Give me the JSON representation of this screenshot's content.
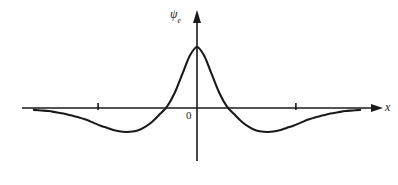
{
  "figure": {
    "background_color": "#ffffff",
    "stroke_color": "#1a1a1a",
    "width": 398,
    "height": 185
  },
  "labels": {
    "y_axis_symbol": "ψ",
    "y_axis_subscript": "e",
    "x_axis": "x",
    "origin": "0"
  },
  "chart_data": {
    "type": "line",
    "title": "",
    "xlabel": "x",
    "ylabel": "ψe",
    "subtitle": "",
    "grid": false,
    "legend": null,
    "axis_style": "arrowed-cartesian",
    "xlim": [
      -3.6,
      3.6
    ],
    "ylim": [
      -0.45,
      1.05
    ],
    "x_tick_values": [
      -2,
      2
    ],
    "x_tick_labels": [
      "",
      ""
    ],
    "y_tick_values": [],
    "y_tick_labels": [],
    "annotations": [
      {
        "text": "0",
        "x": -0.15,
        "y": -0.12,
        "role": "origin-marker"
      },
      {
        "text": "ψe",
        "x": -0.35,
        "y": 1.0,
        "role": "y-axis-name"
      },
      {
        "text": "x",
        "x": 3.55,
        "y": -0.05,
        "role": "x-axis-name"
      }
    ],
    "features": {
      "peak": {
        "x": 0.0,
        "y": 1.0
      },
      "zero_crossings": [
        -0.62,
        0.62
      ],
      "minima": [
        {
          "x": -1.28,
          "y": -0.39
        },
        {
          "x": 1.28,
          "y": -0.39
        }
      ],
      "tails_approach": 0.0,
      "symmetry": "even"
    },
    "series": [
      {
        "name": "psi_e",
        "description": "Symmetric sinc-like wavefunction with central maximum, two side minima and decaying tails",
        "x": [
          -3.3,
          -3.15,
          -3.0,
          -2.85,
          -2.7,
          -2.55,
          -2.4,
          -2.25,
          -2.1,
          -1.95,
          -1.8,
          -1.65,
          -1.5,
          -1.35,
          -1.2,
          -1.05,
          -0.9,
          -0.75,
          -0.6,
          -0.45,
          -0.3,
          -0.15,
          0.0,
          0.15,
          0.3,
          0.45,
          0.6,
          0.75,
          0.9,
          1.05,
          1.2,
          1.35,
          1.5,
          1.65,
          1.8,
          1.95,
          2.1,
          2.25,
          2.4,
          2.55,
          2.7,
          2.85,
          3.0,
          3.15,
          3.3
        ],
        "y": [
          -0.03,
          -0.04,
          -0.05,
          -0.07,
          -0.09,
          -0.12,
          -0.15,
          -0.19,
          -0.24,
          -0.29,
          -0.33,
          -0.37,
          -0.39,
          -0.39,
          -0.37,
          -0.31,
          -0.22,
          -0.1,
          0.03,
          0.25,
          0.55,
          0.85,
          1.0,
          0.85,
          0.55,
          0.25,
          0.03,
          -0.1,
          -0.22,
          -0.31,
          -0.37,
          -0.39,
          -0.39,
          -0.37,
          -0.33,
          -0.29,
          -0.24,
          -0.19,
          -0.15,
          -0.12,
          -0.09,
          -0.07,
          -0.05,
          -0.04,
          -0.03
        ]
      }
    ]
  }
}
